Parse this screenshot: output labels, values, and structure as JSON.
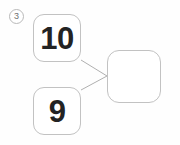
{
  "canvas": {
    "width": 180,
    "height": 145,
    "background_color": "#fefefe"
  },
  "step_badge": {
    "label": "3",
    "shape": "circle",
    "border_color": "#b9b9b9",
    "text_color": "#6f6f6f"
  },
  "diagram": {
    "kind": "addition-combine",
    "line_color": "#b0b0b0",
    "card_border_color": "#c2c2c2",
    "card_fill_color": "#ffffff",
    "value_text_color": "#232323",
    "nodes": [
      {
        "id": "addend-top",
        "name": "card-ten",
        "value": "10",
        "empty": false
      },
      {
        "id": "addend-bottom",
        "name": "card-nine",
        "value": "9",
        "empty": false
      },
      {
        "id": "sum-result",
        "name": "card-result",
        "value": "",
        "empty": true
      }
    ],
    "connectors": [
      {
        "from": "addend-top",
        "to": "sum-result"
      },
      {
        "from": "addend-bottom",
        "to": "sum-result"
      }
    ]
  }
}
